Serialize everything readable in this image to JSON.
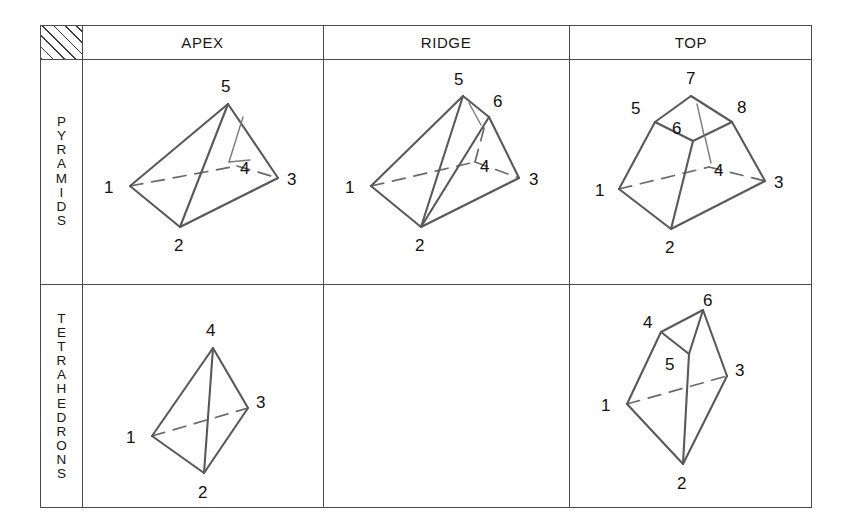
{
  "figure": {
    "corner_cell": "hatched",
    "column_headers": [
      "APEX",
      "RIDGE",
      "TOP"
    ],
    "row_labels": [
      "PYRAMIDS",
      "TETRAHEDRONS"
    ]
  },
  "cells": {
    "pyramid_apex": {
      "node_labels": [
        "1",
        "2",
        "3",
        "4",
        "5"
      ]
    },
    "pyramid_ridge": {
      "node_labels": [
        "1",
        "2",
        "3",
        "4",
        "5",
        "6"
      ]
    },
    "pyramid_top": {
      "node_labels": [
        "1",
        "2",
        "3",
        "4",
        "5",
        "6",
        "7",
        "8"
      ]
    },
    "tetra_apex": {
      "node_labels": [
        "1",
        "2",
        "3",
        "4"
      ]
    },
    "tetra_ridge": {
      "node_labels": []
    },
    "tetra_top": {
      "node_labels": [
        "1",
        "2",
        "3",
        "4",
        "5",
        "6"
      ]
    }
  },
  "colors": {
    "line": "#595959",
    "hidden_line": "#6a6a6a",
    "border": "#4a4a4a",
    "text": "#111111",
    "background": "#ffffff"
  }
}
